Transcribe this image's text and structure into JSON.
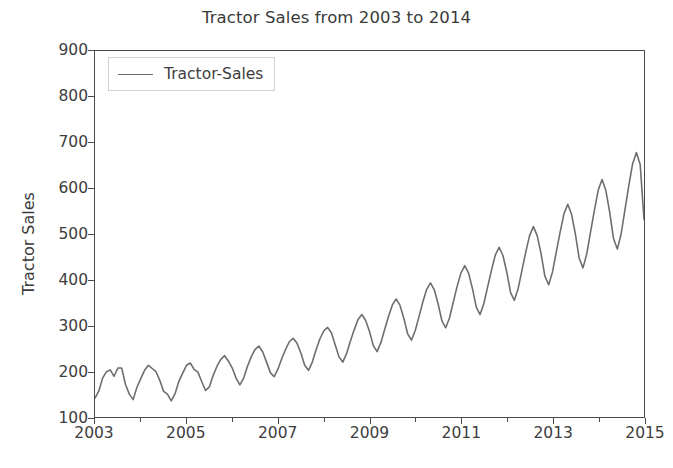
{
  "chart_data": {
    "type": "line",
    "title": "Tractor Sales from 2003 to 2014",
    "xlabel": "",
    "ylabel": "Tractor Sales",
    "grid": false,
    "legend_position": "upper left",
    "xlim": [
      2003.0,
      2015.0
    ],
    "ylim": [
      100,
      900
    ],
    "xticks": [
      2003,
      2005,
      2007,
      2009,
      2011,
      2013,
      2015
    ],
    "xtick_labels": [
      "2003",
      "2005",
      "2007",
      "2009",
      "2011",
      "2013",
      "2015"
    ],
    "xticks_minor": [
      2004,
      2006,
      2008,
      2010,
      2012,
      2014
    ],
    "yticks": [
      100,
      200,
      300,
      400,
      500,
      600,
      700,
      800,
      900
    ],
    "ytick_labels": [
      "100",
      "200",
      "300",
      "400",
      "500",
      "600",
      "700",
      "800",
      "900"
    ],
    "line_color": "#6e6e6e",
    "line_width": 1.6,
    "series": [
      {
        "name": "Tractor-Sales",
        "x_start": "2003-01",
        "x_end": "2014-12",
        "frequency": "monthly",
        "values": [
          141,
          157,
          185,
          199,
          203,
          189,
          207,
          207,
          171,
          150,
          138,
          165,
          184,
          202,
          213,
          206,
          199,
          180,
          156,
          150,
          135,
          151,
          178,
          196,
          213,
          218,
          204,
          198,
          177,
          158,
          166,
          191,
          211,
          226,
          234,
          222,
          207,
          185,
          170,
          185,
          211,
          232,
          248,
          255,
          242,
          220,
          197,
          188,
          205,
          228,
          248,
          265,
          272,
          261,
          240,
          213,
          202,
          220,
          247,
          271,
          288,
          296,
          284,
          258,
          231,
          220,
          239,
          266,
          291,
          313,
          324,
          311,
          287,
          256,
          243,
          263,
          292,
          320,
          345,
          358,
          344,
          316,
          282,
          268,
          289,
          320,
          352,
          379,
          393,
          378,
          347,
          310,
          295,
          317,
          352,
          386,
          415,
          431,
          414,
          381,
          340,
          324,
          348,
          385,
          421,
          454,
          471,
          453,
          417,
          372,
          355,
          381,
          421,
          461,
          497,
          516,
          496,
          457,
          408,
          389,
          417,
          461,
          504,
          544,
          565,
          543,
          500,
          447,
          426,
          457,
          505,
          552,
          596,
          619,
          595,
          548,
          490,
          467,
          500,
          553,
          605,
          653,
          678,
          652,
          532
        ],
        "annual_peaks": [
          {
            "year": 2003,
            "value": 207
          },
          {
            "year": 2004,
            "value": 213
          },
          {
            "year": 2005,
            "value": 234
          },
          {
            "year": 2006,
            "value": 255
          },
          {
            "year": 2007,
            "value": 272
          },
          {
            "year": 2008,
            "value": 296
          },
          {
            "year": 2009,
            "value": 324
          },
          {
            "year": 2010,
            "value": 358
          },
          {
            "year": 2011,
            "value": 393
          },
          {
            "year": 2012,
            "value": 431
          },
          {
            "year": 2013,
            "value": 471
          },
          {
            "year": 2014,
            "value": 516
          }
        ],
        "min_value": 141,
        "max_value": 875,
        "first_value": 141,
        "last_value": 528
      }
    ]
  },
  "legend": {
    "items": [
      {
        "label": "Tractor-Sales",
        "color": "#6e6e6e"
      }
    ]
  },
  "axes": {
    "frame_color": "#4a4a4a",
    "tick_color": "#4a4a4a",
    "text_color": "#3d3d3d"
  }
}
